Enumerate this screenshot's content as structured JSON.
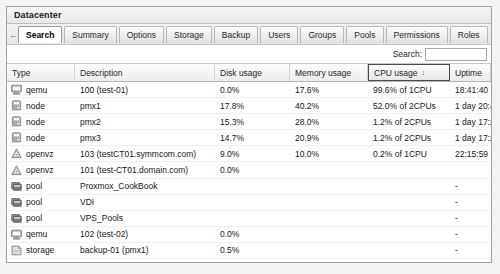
{
  "window": {
    "title": "Datacenter"
  },
  "nav": {
    "back_icon": "arrow-left-icon",
    "back_glyph": "←",
    "tabs": [
      {
        "label": "Search",
        "active": true
      },
      {
        "label": "Summary",
        "active": false
      },
      {
        "label": "Options",
        "active": false
      },
      {
        "label": "Storage",
        "active": false
      },
      {
        "label": "Backup",
        "active": false
      },
      {
        "label": "Users",
        "active": false
      },
      {
        "label": "Groups",
        "active": false
      },
      {
        "label": "Pools",
        "active": false
      },
      {
        "label": "Permissions",
        "active": false
      },
      {
        "label": "Roles",
        "active": false
      }
    ]
  },
  "search": {
    "label": "Search:",
    "value": "",
    "placeholder": ""
  },
  "table": {
    "columns": [
      {
        "key": "type",
        "label": "Type",
        "sorted": false,
        "sort_dir": ""
      },
      {
        "key": "desc",
        "label": "Description",
        "sorted": false,
        "sort_dir": ""
      },
      {
        "key": "disk",
        "label": "Disk usage",
        "sorted": false,
        "sort_dir": ""
      },
      {
        "key": "mem",
        "label": "Memory usage",
        "sorted": false,
        "sort_dir": ""
      },
      {
        "key": "cpu",
        "label": "CPU usage",
        "sorted": true,
        "sort_dir": "↓"
      },
      {
        "key": "uptime",
        "label": "Uptime",
        "sorted": false,
        "sort_dir": ""
      }
    ],
    "rows": [
      {
        "icon": "monitor-icon",
        "type": "qemu",
        "desc": "100 (test-01)",
        "disk": "0.0%",
        "mem": "17.6%",
        "cpu": "99.6% of 1CPU",
        "uptime": "18:41:40"
      },
      {
        "icon": "server-icon",
        "type": "node",
        "desc": "pmx1",
        "disk": "17.8%",
        "mem": "40.2%",
        "cpu": "52.0% of 2CPUs",
        "uptime": "1 day 20:41:20"
      },
      {
        "icon": "server-icon",
        "type": "node",
        "desc": "pmx2",
        "disk": "15.3%",
        "mem": "28.0%",
        "cpu": "1.2% of 2CPUs",
        "uptime": "1 day 17:27:52"
      },
      {
        "icon": "server-icon",
        "type": "node",
        "desc": "pmx3",
        "disk": "14.7%",
        "mem": "20.9%",
        "cpu": "1.2% of 2CPUs",
        "uptime": "1 day 17:27:54"
      },
      {
        "icon": "container-icon",
        "type": "openvz",
        "desc": "103 (testCT01.symmcom.com)",
        "disk": "9.0%",
        "mem": "10.0%",
        "cpu": "0.2% of 1CPU",
        "uptime": "22:15:59"
      },
      {
        "icon": "container-icon",
        "type": "openvz",
        "desc": "101 (test-CT01.domain.com)",
        "disk": "0.0%",
        "mem": "",
        "cpu": "",
        "uptime": ""
      },
      {
        "icon": "pool-icon",
        "type": "pool",
        "desc": "Proxmox_CookBook",
        "disk": "",
        "mem": "",
        "cpu": "",
        "uptime": "-"
      },
      {
        "icon": "pool-icon",
        "type": "pool",
        "desc": "VDI",
        "disk": "",
        "mem": "",
        "cpu": "",
        "uptime": "-"
      },
      {
        "icon": "pool-icon",
        "type": "pool",
        "desc": "VPS_Pools",
        "disk": "",
        "mem": "",
        "cpu": "",
        "uptime": "-"
      },
      {
        "icon": "monitor-icon",
        "type": "qemu",
        "desc": "102 (test-02)",
        "disk": "0.0%",
        "mem": "",
        "cpu": "",
        "uptime": "-"
      },
      {
        "icon": "storage-icon",
        "type": "storage",
        "desc": "backup-01 (pmx1)",
        "disk": "0.5%",
        "mem": "",
        "cpu": "",
        "uptime": "-"
      }
    ]
  },
  "colors": {
    "panel_border": "#a0a0a0",
    "header_bg": "#ececec",
    "active_tab_bg": "#ffffff",
    "text": "#161616",
    "sort_border": "#4a4a4a"
  }
}
